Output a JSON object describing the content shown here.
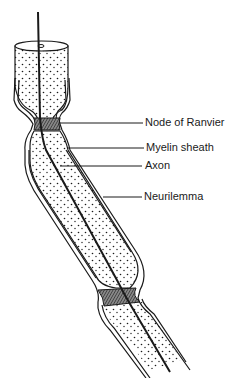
{
  "diagram": {
    "labels": [
      {
        "id": "node",
        "text": "Node of Ranvier"
      },
      {
        "id": "myelin",
        "text": "Myelin sheath"
      },
      {
        "id": "axon",
        "text": "Axon"
      },
      {
        "id": "neurilemma",
        "text": "Neurilemma"
      }
    ],
    "colors": {
      "ink": "#1a1a1a",
      "background": "#ffffff",
      "node_fill": "#555555"
    }
  }
}
